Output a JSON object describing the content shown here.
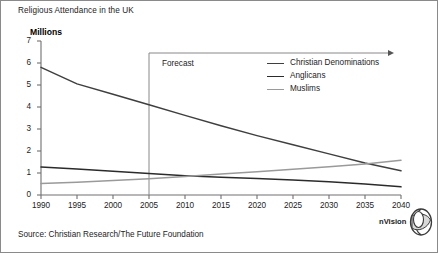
{
  "chart": {
    "title": "Religious Attendance in the UK",
    "ylabel": "Millions",
    "source": "Source: Christian Research/The Future Foundation",
    "forecast_label": "Forecast",
    "forecast_start_year": 2005,
    "logo_text": "nVision",
    "logo_icon": "nvision-sphere-icon"
  },
  "chart_data": {
    "type": "line",
    "title": "Religious Attendance in the UK",
    "xlabel": "",
    "ylabel": "Millions",
    "xlim": [
      1990,
      2040
    ],
    "ylim": [
      0,
      7
    ],
    "ytick_labels": [
      "0",
      "1",
      "2",
      "3",
      "4",
      "5",
      "6",
      "7"
    ],
    "yticks": [
      0,
      1,
      2,
      3,
      4,
      5,
      6,
      7
    ],
    "xtick_labels": [
      "1990",
      "1995",
      "2000",
      "2005",
      "2010",
      "2015",
      "2020",
      "2025",
      "2030",
      "2035",
      "2040"
    ],
    "x": [
      1990,
      1995,
      2000,
      2005,
      2010,
      2015,
      2020,
      2025,
      2030,
      2035,
      2040
    ],
    "grid": false,
    "legend_position": "upper right",
    "annotations": [
      {
        "text": "Forecast",
        "x": 2005,
        "note": "vertical divider at 2005 with arrow spanning to 2040 at y=6.2"
      }
    ],
    "series": [
      {
        "name": "Christian Denominations",
        "color": "#3f3f3f",
        "values": [
          5.8,
          5.05,
          4.58,
          4.1,
          3.62,
          3.15,
          2.7,
          2.28,
          1.87,
          1.45,
          1.1
        ]
      },
      {
        "name": "Anglicans",
        "color": "#2b2b2b",
        "values": [
          1.27,
          1.18,
          1.08,
          0.98,
          0.88,
          0.81,
          0.75,
          0.68,
          0.6,
          0.5,
          0.37
        ]
      },
      {
        "name": "Muslims",
        "color": "#9a9a9a",
        "values": [
          0.52,
          0.58,
          0.66,
          0.74,
          0.84,
          0.95,
          1.06,
          1.17,
          1.28,
          1.41,
          1.58
        ]
      }
    ]
  },
  "legend": {
    "items": [
      {
        "label": "Christian Denominations",
        "color": "#3f3f3f"
      },
      {
        "label": "Anglicans",
        "color": "#2b2b2b"
      },
      {
        "label": "Muslims",
        "color": "#9a9a9a"
      }
    ]
  }
}
